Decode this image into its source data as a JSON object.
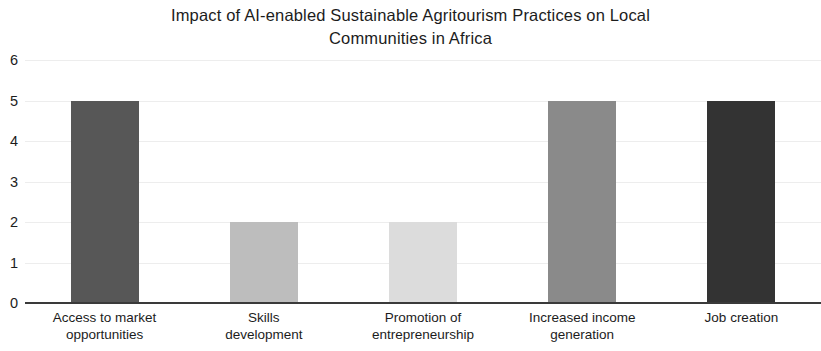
{
  "chart_data": {
    "type": "bar",
    "title": "Impact of AI-enabled Sustainable Agritourism Practices on Local\nCommunities in Africa",
    "xlabel": "",
    "ylabel": "",
    "categories": [
      "Access to market\nopportunities",
      "Skills\ndevelopment",
      "Promotion of\nentrepreneurship",
      "Increased income\ngeneration",
      "Job creation"
    ],
    "values": [
      5,
      2,
      2,
      5,
      5
    ],
    "bar_colors": [
      "#575757",
      "#bdbdbd",
      "#dcdcdc",
      "#8a8a8a",
      "#333333"
    ],
    "ylim": [
      0,
      6
    ],
    "ytick_labels": [
      "0",
      "1",
      "2",
      "3",
      "4",
      "5",
      "6"
    ],
    "ytick_values": [
      0,
      1,
      2,
      3,
      4,
      5,
      6
    ],
    "grid": true,
    "grid_color": "#ededed",
    "legend": null,
    "axis_color": "#3a3a3a",
    "background": "#ffffff"
  }
}
